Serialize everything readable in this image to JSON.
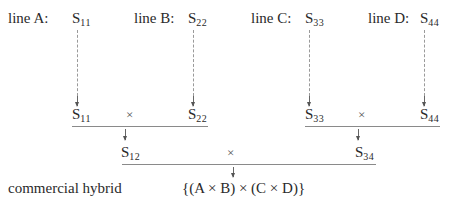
{
  "diagram": {
    "parents": [
      {
        "label": "line A:",
        "symbol": "S",
        "subscript": "11"
      },
      {
        "label": "line B:",
        "symbol": "S",
        "subscript": "22"
      },
      {
        "label": "line C:",
        "symbol": "S",
        "subscript": "33"
      },
      {
        "label": "line D:",
        "symbol": "S",
        "subscript": "44"
      }
    ],
    "cross_symbol": "×",
    "single_crosses": [
      {
        "symbol": "S",
        "subscript": "12",
        "from": [
          "S11",
          "S22"
        ]
      },
      {
        "symbol": "S",
        "subscript": "34",
        "from": [
          "S33",
          "S44"
        ]
      }
    ],
    "final": {
      "label": "commercial hybrid",
      "formula": "{(A × B) × (C × D)}"
    },
    "colors": {
      "text": "#2a2a2a",
      "lines": "#8a8a8a",
      "dashed": "#9a9a9a"
    }
  }
}
